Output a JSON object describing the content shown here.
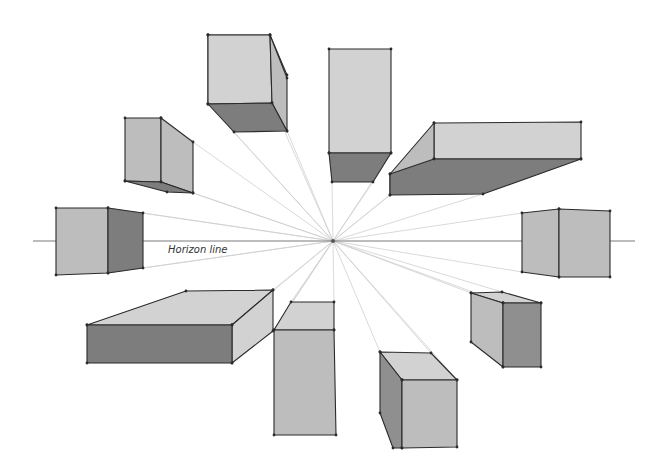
{
  "diagram": {
    "type": "one-point perspective illustration",
    "horizon_label": "Horizon line",
    "vanishing_point": [
      333,
      241
    ],
    "horizon": {
      "y": 241,
      "x1": 33,
      "x2": 635
    },
    "colors": {
      "light": "#d2d2d2",
      "mid": "#bdbdbd",
      "dark": "#8f8f8f",
      "darker": "#7d7d7d",
      "stroke": "#2b2b2b",
      "guide": "#cfcfcf"
    },
    "boxes": [
      {
        "name": "box-top-left-above",
        "faces": [
          {
            "pts": "208,35 270,35 287,75 235,80",
            "shade": "mid"
          },
          {
            "pts": "208,35 235,80 235,112 208,104",
            "shade": "mid"
          },
          {
            "pts": "208,35 270,35 272,103 208,104",
            "shade": "light"
          },
          {
            "pts": "270,35 287,78 287,131 272,103",
            "shade": "mid"
          },
          {
            "pts": "208,104 272,103 287,131 234,132",
            "shade": "darker"
          }
        ]
      },
      {
        "name": "box-top-center-above",
        "faces": [
          {
            "pts": "329,49 391,49 391,153 329,153",
            "shade": "light"
          },
          {
            "pts": "329,153 391,153 373,182 332,182",
            "shade": "darker"
          }
        ]
      },
      {
        "name": "box-top-right-flat",
        "faces": [
          {
            "pts": "434,123 581,122 581,159 434,159",
            "shade": "light"
          },
          {
            "pts": "434,123 434,159 390,195 390,174",
            "shade": "mid"
          },
          {
            "pts": "390,174 434,159 581,159 483,194 390,195",
            "shade": "darker"
          }
        ]
      },
      {
        "name": "box-left-upper",
        "faces": [
          {
            "pts": "125,118 161,118 161,182 125,181",
            "shade": "mid"
          },
          {
            "pts": "161,118 193,142 193,193 161,182",
            "shade": "mid"
          },
          {
            "pts": "125,181 161,182 193,193 167,192",
            "shade": "darker"
          }
        ]
      },
      {
        "name": "box-left-horizon",
        "faces": [
          {
            "pts": "56,208 108,208 108,273 56,275",
            "shade": "mid"
          },
          {
            "pts": "108,208 143,213 143,268 108,273",
            "shade": "darker"
          }
        ]
      },
      {
        "name": "box-right-horizon",
        "faces": [
          {
            "pts": "522,213 559,209 559,277 522,272",
            "shade": "mid"
          },
          {
            "pts": "559,209 610,211 610,277 559,277",
            "shade": "mid"
          }
        ]
      },
      {
        "name": "box-bottom-left-flat",
        "faces": [
          {
            "pts": "87,325 186,291 273,290 232,325",
            "shade": "light"
          },
          {
            "pts": "232,325 273,290 273,331 232,363",
            "shade": "light"
          },
          {
            "pts": "87,325 232,325 232,363 87,363",
            "shade": "darker"
          }
        ]
      },
      {
        "name": "box-bottom-center",
        "faces": [
          {
            "pts": "291,302 334,302 334,330 274,330",
            "shade": "light"
          },
          {
            "pts": "274,330 334,330 336,435 274,435",
            "shade": "mid"
          }
        ]
      },
      {
        "name": "box-bottom-right-center",
        "faces": [
          {
            "pts": "380,352 431,353 457,380 402,380",
            "shade": "light"
          },
          {
            "pts": "380,352 402,380 402,448 393,448 380,413",
            "shade": "dark"
          },
          {
            "pts": "402,380 457,380 457,447 402,448",
            "shade": "mid"
          }
        ]
      },
      {
        "name": "box-right-lower",
        "faces": [
          {
            "pts": "471,293 502,292 541,303 503,303",
            "shade": "light"
          },
          {
            "pts": "471,293 503,303 503,367 471,342",
            "shade": "mid"
          },
          {
            "pts": "503,303 541,303 541,367 503,367",
            "shade": "dark"
          }
        ]
      }
    ],
    "guide_lines": [
      [
        208,
        104
      ],
      [
        234,
        132
      ],
      [
        287,
        131
      ],
      [
        272,
        103
      ],
      [
        332,
        182
      ],
      [
        373,
        182
      ],
      [
        391,
        153
      ],
      [
        390,
        195
      ],
      [
        483,
        194
      ],
      [
        434,
        159
      ],
      [
        161,
        182
      ],
      [
        193,
        193
      ],
      [
        193,
        142
      ],
      [
        108,
        208
      ],
      [
        143,
        213
      ],
      [
        143,
        268
      ],
      [
        108,
        273
      ],
      [
        522,
        213
      ],
      [
        522,
        272
      ],
      [
        273,
        290
      ],
      [
        232,
        325
      ],
      [
        273,
        331
      ],
      [
        274,
        330
      ],
      [
        291,
        302
      ],
      [
        334,
        302
      ],
      [
        380,
        352
      ],
      [
        431,
        353
      ],
      [
        457,
        380
      ],
      [
        471,
        293
      ],
      [
        502,
        292
      ],
      [
        503,
        303
      ]
    ]
  }
}
